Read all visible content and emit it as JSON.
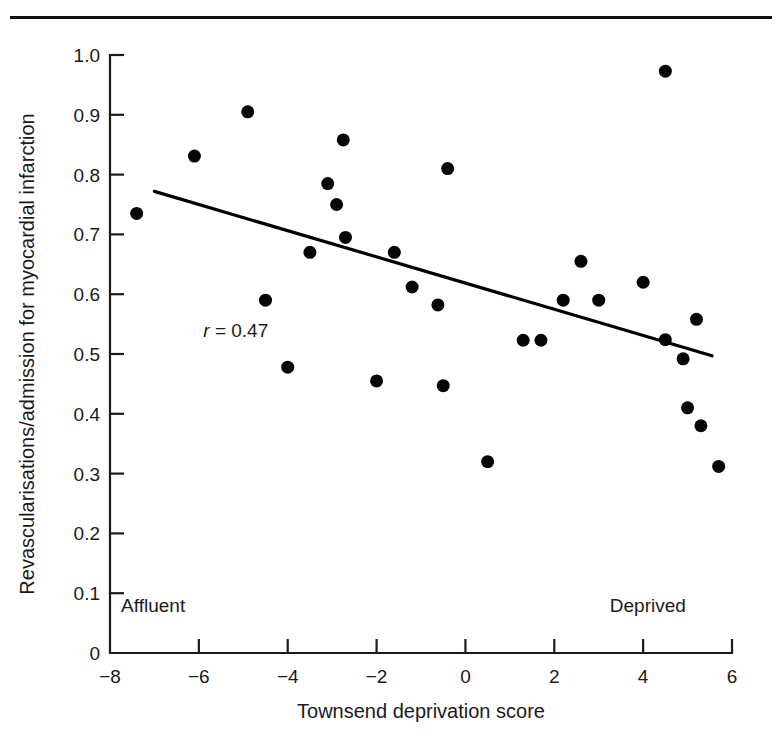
{
  "figure": {
    "top_rule_visible": true,
    "background_color": "#ffffff",
    "ink_color": "#111111"
  },
  "chart_data": {
    "type": "scatter",
    "title": "",
    "xlabel": "Townsend deprivation score",
    "ylabel": "Revascularisations/admission for myocardial infarction",
    "xlim": [
      -8,
      6
    ],
    "ylim": [
      0,
      1.0
    ],
    "xticks": [
      -8,
      -6,
      -4,
      -2,
      0,
      2,
      4,
      6
    ],
    "xtick_labels": [
      "−8",
      "−6",
      "−4",
      "−2",
      "0",
      "2",
      "4",
      "6"
    ],
    "yticks": [
      0,
      0.1,
      0.2,
      0.3,
      0.4,
      0.5,
      0.6,
      0.7,
      0.8,
      0.9,
      1.0
    ],
    "ytick_labels": [
      "0",
      "0.1",
      "0.2",
      "0.3",
      "0.4",
      "0.5",
      "0.6",
      "0.7",
      "0.8",
      "0.9",
      "1.0"
    ],
    "grid": false,
    "legend": null,
    "marker": "filled-circle",
    "marker_color": "#050505",
    "marker_size_px": 13,
    "annotations": [
      {
        "name": "correlation",
        "text_italic": "r",
        "text_rest": " = 0.47",
        "x": -5.9,
        "y": 0.528
      },
      {
        "name": "affluent-end-label",
        "text": "Affluent",
        "x": -7.75,
        "y": 0.068
      },
      {
        "name": "deprived-end-label",
        "text": "Deprived",
        "x": 3.25,
        "y": 0.068
      }
    ],
    "fit_line": {
      "name": "regression-line",
      "x_start": -7.0,
      "y_start": 0.772,
      "x_end": 5.55,
      "y_end": 0.497,
      "color": "#000000"
    },
    "points": [
      {
        "x": -7.4,
        "y": 0.735
      },
      {
        "x": -6.1,
        "y": 0.831
      },
      {
        "x": -4.9,
        "y": 0.905
      },
      {
        "x": -4.5,
        "y": 0.59
      },
      {
        "x": -4.0,
        "y": 0.478
      },
      {
        "x": -3.5,
        "y": 0.67
      },
      {
        "x": -3.1,
        "y": 0.785
      },
      {
        "x": -2.9,
        "y": 0.75
      },
      {
        "x": -2.75,
        "y": 0.858
      },
      {
        "x": -2.7,
        "y": 0.695
      },
      {
        "x": -2.0,
        "y": 0.455
      },
      {
        "x": -1.6,
        "y": 0.67
      },
      {
        "x": -1.2,
        "y": 0.612
      },
      {
        "x": -0.62,
        "y": 0.582
      },
      {
        "x": -0.5,
        "y": 0.447
      },
      {
        "x": -0.4,
        "y": 0.81
      },
      {
        "x": 0.5,
        "y": 0.32
      },
      {
        "x": 1.3,
        "y": 0.523
      },
      {
        "x": 1.7,
        "y": 0.523
      },
      {
        "x": 2.2,
        "y": 0.59
      },
      {
        "x": 2.6,
        "y": 0.655
      },
      {
        "x": 3.0,
        "y": 0.59
      },
      {
        "x": 4.0,
        "y": 0.62
      },
      {
        "x": 4.5,
        "y": 0.973
      },
      {
        "x": 4.5,
        "y": 0.524
      },
      {
        "x": 4.9,
        "y": 0.492
      },
      {
        "x": 5.0,
        "y": 0.41
      },
      {
        "x": 5.2,
        "y": 0.558
      },
      {
        "x": 5.3,
        "y": 0.38
      },
      {
        "x": 5.7,
        "y": 0.312
      }
    ]
  }
}
